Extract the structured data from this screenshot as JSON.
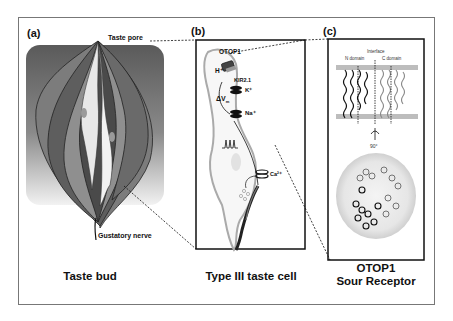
{
  "figure": {
    "panels": [
      {
        "letter": "(a)",
        "caption": "Taste bud",
        "labels": {
          "top": "Taste pore",
          "bottom": "Gustatory nerve"
        }
      },
      {
        "letter": "(b)",
        "caption": "Type III taste cell",
        "labels": {
          "channel": "OTOP1",
          "proton": "H⁺",
          "kir": "KIR2.1",
          "potassium": "K⁺",
          "voltage": "ΔV",
          "voltage_sub": "m",
          "sodium": "Na⁺",
          "calcium": "Ca²⁺"
        }
      },
      {
        "letter": "(c)",
        "caption_line1": "OTOP1",
        "caption_line2": "Sour Receptor",
        "labels": {
          "interface": "Interface",
          "n_domain": "N domain",
          "c_domain": "C domain",
          "rotation": "90°"
        }
      }
    ]
  }
}
